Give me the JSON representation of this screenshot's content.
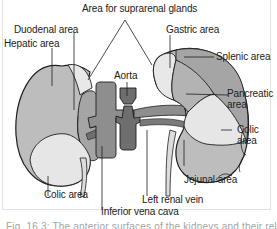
{
  "figure": {
    "labels": {
      "suprarenal": "Area for suprarenal glands",
      "duodenal": "Duodenal area",
      "hepatic": "Hepatic area",
      "aorta": "Aorta",
      "gastric": "Gastric area",
      "splenic": "Splenic area",
      "pancreatic_1": "Pancreatic",
      "pancreatic_2": "area",
      "colic_right_1": "Colic",
      "colic_right_2": "area",
      "colic_left": "Colic area",
      "jejunal": "Jejunal area",
      "left_renal_vein": "Left renal vein",
      "ivc": "Inferior vena cava"
    },
    "caption": "Fig. 16.3: The anterior surfaces of the kidneys and their relations"
  },
  "colors": {
    "kidney_fill": "#bdbdbd",
    "light_area": "#e6e6e6",
    "mid_area": "#a9a9a9",
    "dark_vessel": "#6e6e6e",
    "ivc": "#8e8e8e",
    "outline": "#1e1e1e"
  }
}
